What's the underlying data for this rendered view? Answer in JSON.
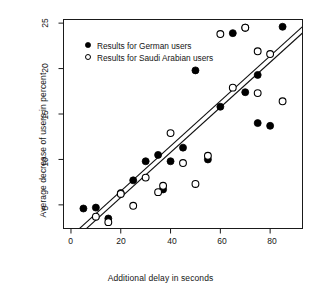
{
  "chart_data": {
    "type": "scatter",
    "title": "",
    "xlabel": "Additional delay in seconds",
    "ylabel": "Average decrease of users in percent",
    "xlim": [
      -3,
      93
    ],
    "ylim": [
      2.4,
      25.4
    ],
    "xticks": [
      0,
      20,
      40,
      60,
      80
    ],
    "yticks": [
      5,
      10,
      15,
      20,
      25
    ],
    "grid": false,
    "legend_position": "top-left",
    "series": [
      {
        "name": "Results for German users",
        "marker": "filled-circle",
        "color": "#000000",
        "points": [
          [
            5,
            4.6
          ],
          [
            10,
            4.7
          ],
          [
            15,
            3.5
          ],
          [
            20,
            6.3
          ],
          [
            25,
            7.7
          ],
          [
            30,
            9.8
          ],
          [
            35,
            10.5
          ],
          [
            37,
            6.7
          ],
          [
            40,
            9.8
          ],
          [
            45,
            11.3
          ],
          [
            50,
            19.8
          ],
          [
            55,
            10.0
          ],
          [
            60,
            15.8
          ],
          [
            65,
            23.9
          ],
          [
            70,
            24.5
          ],
          [
            70,
            17.4
          ],
          [
            75,
            19.3
          ],
          [
            75,
            14.0
          ],
          [
            80,
            13.7
          ],
          [
            85,
            24.6
          ]
        ],
        "trendline": {
          "intercept": 1.55,
          "slope": 0.248
        }
      },
      {
        "name": "Results for Saudi Arabian users",
        "marker": "open-circle",
        "color": "#000000",
        "points": [
          [
            10,
            3.7
          ],
          [
            15,
            3.1
          ],
          [
            20,
            6.2
          ],
          [
            25,
            4.9
          ],
          [
            30,
            8.0
          ],
          [
            35,
            6.4
          ],
          [
            37,
            7.1
          ],
          [
            40,
            12.9
          ],
          [
            45,
            9.6
          ],
          [
            50,
            7.3
          ],
          [
            55,
            10.4
          ],
          [
            60,
            23.8
          ],
          [
            65,
            17.9
          ],
          [
            70,
            24.5
          ],
          [
            75,
            21.9
          ],
          [
            75,
            17.3
          ],
          [
            80,
            21.6
          ],
          [
            85,
            16.4
          ]
        ],
        "trendline": {
          "intercept": 0.85,
          "slope": 0.248
        }
      }
    ]
  },
  "axes": {
    "x": {
      "label": "Additional delay in seconds",
      "tick_labels": [
        "0",
        "20",
        "40",
        "60",
        "80"
      ]
    },
    "y": {
      "label": "Average decrease of users in percent",
      "tick_labels": [
        "5",
        "10",
        "15",
        "20",
        "25"
      ]
    }
  },
  "legend": {
    "entries": [
      {
        "label": "Results for German users",
        "marker": "filled-circle"
      },
      {
        "label": "Results for Saudi Arabian users",
        "marker": "open-circle"
      }
    ]
  },
  "style": {
    "axis_color": "#1a1a1a",
    "marker_color": "#000000",
    "background": "#ffffff"
  }
}
